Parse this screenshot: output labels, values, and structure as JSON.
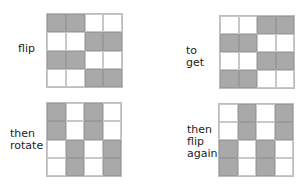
{
  "colors": {
    "shaded": "#a9a9a9",
    "unshaded": "#ffffff",
    "grid_line": "#c8c8c8"
  },
  "panels": [
    {
      "label": "flip",
      "cells": [
        [
          1,
          1,
          0,
          0
        ],
        [
          0,
          0,
          1,
          1
        ],
        [
          1,
          1,
          0,
          0
        ],
        [
          0,
          0,
          1,
          1
        ]
      ]
    },
    {
      "label": "to get",
      "cells": [
        [
          0,
          0,
          1,
          1
        ],
        [
          1,
          1,
          0,
          0
        ],
        [
          0,
          0,
          1,
          1
        ],
        [
          1,
          1,
          0,
          0
        ]
      ]
    },
    {
      "label": "then\nrotate",
      "label_lines": [
        "then",
        "rotate"
      ],
      "cells": [
        [
          1,
          0,
          1,
          0
        ],
        [
          1,
          0,
          1,
          0
        ],
        [
          0,
          1,
          0,
          1
        ],
        [
          0,
          1,
          0,
          1
        ]
      ]
    },
    {
      "label": "then\nflip\nagain",
      "label_lines": [
        "then",
        "flip",
        "again"
      ],
      "cells": [
        [
          0,
          1,
          0,
          1
        ],
        [
          0,
          1,
          0,
          1
        ],
        [
          1,
          0,
          1,
          0
        ],
        [
          1,
          0,
          1,
          0
        ]
      ]
    }
  ]
}
